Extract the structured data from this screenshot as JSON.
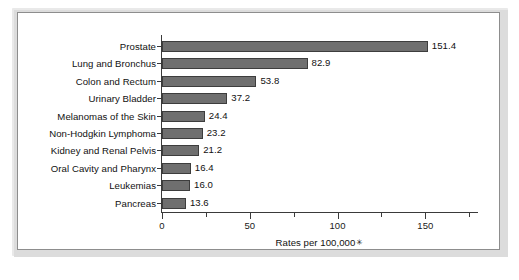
{
  "figure": {
    "frame_color": "#8d8d8d",
    "background_color": "#ffffff"
  },
  "chart_data": {
    "type": "bar",
    "orientation": "horizontal",
    "title": "",
    "subtitle": "",
    "xlabel": "Rates per 100,000",
    "xlabel_footnote_marker": "✳",
    "ylabel": "",
    "categories": [
      "Prostate",
      "Lung and Bronchus",
      "Colon and Rectum",
      "Urinary Bladder",
      "Melanomas of the Skin",
      "Non-Hodgkin Lymphoma",
      "Kidney and Renal Pelvis",
      "Oral Cavity and Pharynx",
      "Leukemias",
      "Pancreas"
    ],
    "values": [
      151.4,
      82.9,
      53.8,
      37.2,
      24.4,
      23.2,
      21.2,
      16.4,
      16.0,
      13.6
    ],
    "value_labels": [
      "151.4",
      "82.9",
      "53.8",
      "37.2",
      "24.4",
      "23.2",
      "21.2",
      "16.4",
      "16.0",
      "13.6"
    ],
    "xlim": [
      0,
      180
    ],
    "xticks": [
      0,
      50,
      100,
      150
    ],
    "xtick_labels": [
      "0",
      "50",
      "100",
      "150"
    ],
    "xminor_ticks": [
      25,
      75,
      125,
      175
    ],
    "grid": false,
    "legend": null,
    "bar_color": "#6f6f6f",
    "bar_edge_color": "#3d3d3d",
    "axis_color": "#3a3a3a"
  }
}
